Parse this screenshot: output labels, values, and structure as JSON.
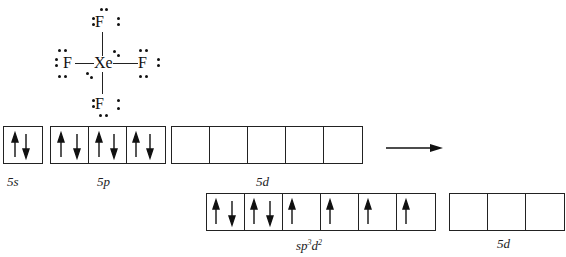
{
  "lewis_structure": {
    "molecule": "XeF4",
    "central_atom": "Xe",
    "ligand_atom": "F",
    "ligands": [
      "F-top",
      "F-left",
      "F-right",
      "F-bottom"
    ]
  },
  "ground_state": {
    "groups": [
      {
        "label_main": "5",
        "label_sub": "s",
        "electrons": [
          [
            "up",
            "down"
          ]
        ]
      },
      {
        "label_main": "5",
        "label_sub": "p",
        "electrons": [
          [
            "up",
            "down"
          ],
          [
            "up",
            "down"
          ],
          [
            "up",
            "down"
          ]
        ]
      },
      {
        "label_main": "5",
        "label_sub": "d",
        "electrons": [
          [],
          [],
          [],
          [],
          []
        ]
      }
    ]
  },
  "arrow": {
    "direction": "right"
  },
  "hybridized_state": {
    "groups": [
      {
        "label_main": "sp",
        "sup1": "3",
        "label_mid": "d",
        "sup2": "2",
        "electrons": [
          [
            "up",
            "down"
          ],
          [
            "up",
            "down"
          ],
          [
            "up"
          ],
          [
            "up"
          ],
          [
            "up"
          ],
          [
            "up"
          ]
        ]
      },
      {
        "label_main": "5",
        "label_sub": "d",
        "electrons": [
          [],
          [],
          []
        ]
      }
    ]
  },
  "colors": {
    "ink": "#111111",
    "background": "#ffffff"
  }
}
